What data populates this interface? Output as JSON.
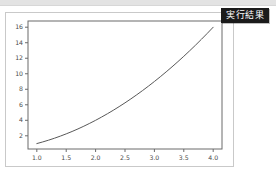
{
  "badge": {
    "label": "実行結果",
    "bg_color": "#1b1b1b",
    "text_color": "#ffffff"
  },
  "figure": {
    "background": "#ffffff",
    "border_color": "#c9c9c9"
  },
  "top_band": {
    "color": "#e3e3e3"
  },
  "chart_data": {
    "type": "line",
    "title": "",
    "xlabel": "",
    "ylabel": "",
    "xlim": [
      0.85,
      4.15
    ],
    "ylim": [
      0.3,
      16.8
    ],
    "grid": false,
    "legend": null,
    "line_color": "#585858",
    "line_width": 1,
    "xticks": [
      1.0,
      1.5,
      2.0,
      2.5,
      3.0,
      3.5,
      4.0
    ],
    "xtick_labels": [
      "1.0",
      "1.5",
      "2.0",
      "2.5",
      "3.0",
      "3.5",
      "4.0"
    ],
    "yticks": [
      2,
      4,
      6,
      8,
      10,
      12,
      14,
      16
    ],
    "ytick_labels": [
      "2",
      "4",
      "6",
      "8",
      "10",
      "12",
      "14",
      "16"
    ],
    "series": [
      {
        "name": "y = x^2",
        "x": [
          1.0,
          1.1,
          1.2,
          1.3,
          1.4,
          1.5,
          1.6,
          1.7,
          1.8,
          1.9,
          2.0,
          2.1,
          2.2,
          2.3,
          2.4,
          2.5,
          2.6,
          2.7,
          2.8,
          2.9,
          3.0,
          3.1,
          3.2,
          3.3,
          3.4,
          3.5,
          3.6,
          3.7,
          3.8,
          3.9,
          4.0
        ],
        "y": [
          1.0,
          1.21,
          1.44,
          1.69,
          1.96,
          2.25,
          2.56,
          2.89,
          3.24,
          3.61,
          4.0,
          4.41,
          4.84,
          5.29,
          5.76,
          6.25,
          6.76,
          7.29,
          7.84,
          8.41,
          9.0,
          9.61,
          10.24,
          10.89,
          11.56,
          12.25,
          12.96,
          13.69,
          14.44,
          15.21,
          16.0
        ]
      }
    ]
  }
}
